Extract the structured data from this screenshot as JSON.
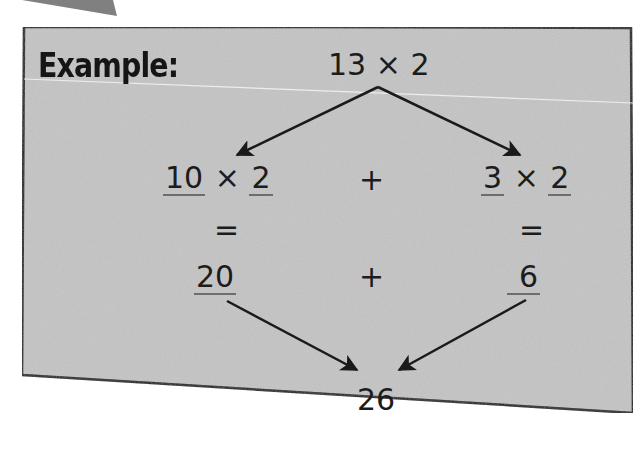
{
  "card": {
    "title": "Example:",
    "background_color": "#c4c4c4",
    "border_color": "#1e1e1e"
  },
  "decomposition": {
    "problem": "13 × 2",
    "left_branch": {
      "tens": "10",
      "times": "×",
      "multiplier": "2",
      "equals": "=",
      "product": "20"
    },
    "right_branch": {
      "ones": "3",
      "times": "×",
      "multiplier": "2",
      "equals": "=",
      "product": "6"
    },
    "plus_top": "+",
    "plus_bottom": "+",
    "result": "26"
  },
  "colors": {
    "text": "#1c1c1c",
    "arrow": "#1a1a1a",
    "underline": "#6d6d6d",
    "corner_tab": "#808080"
  }
}
